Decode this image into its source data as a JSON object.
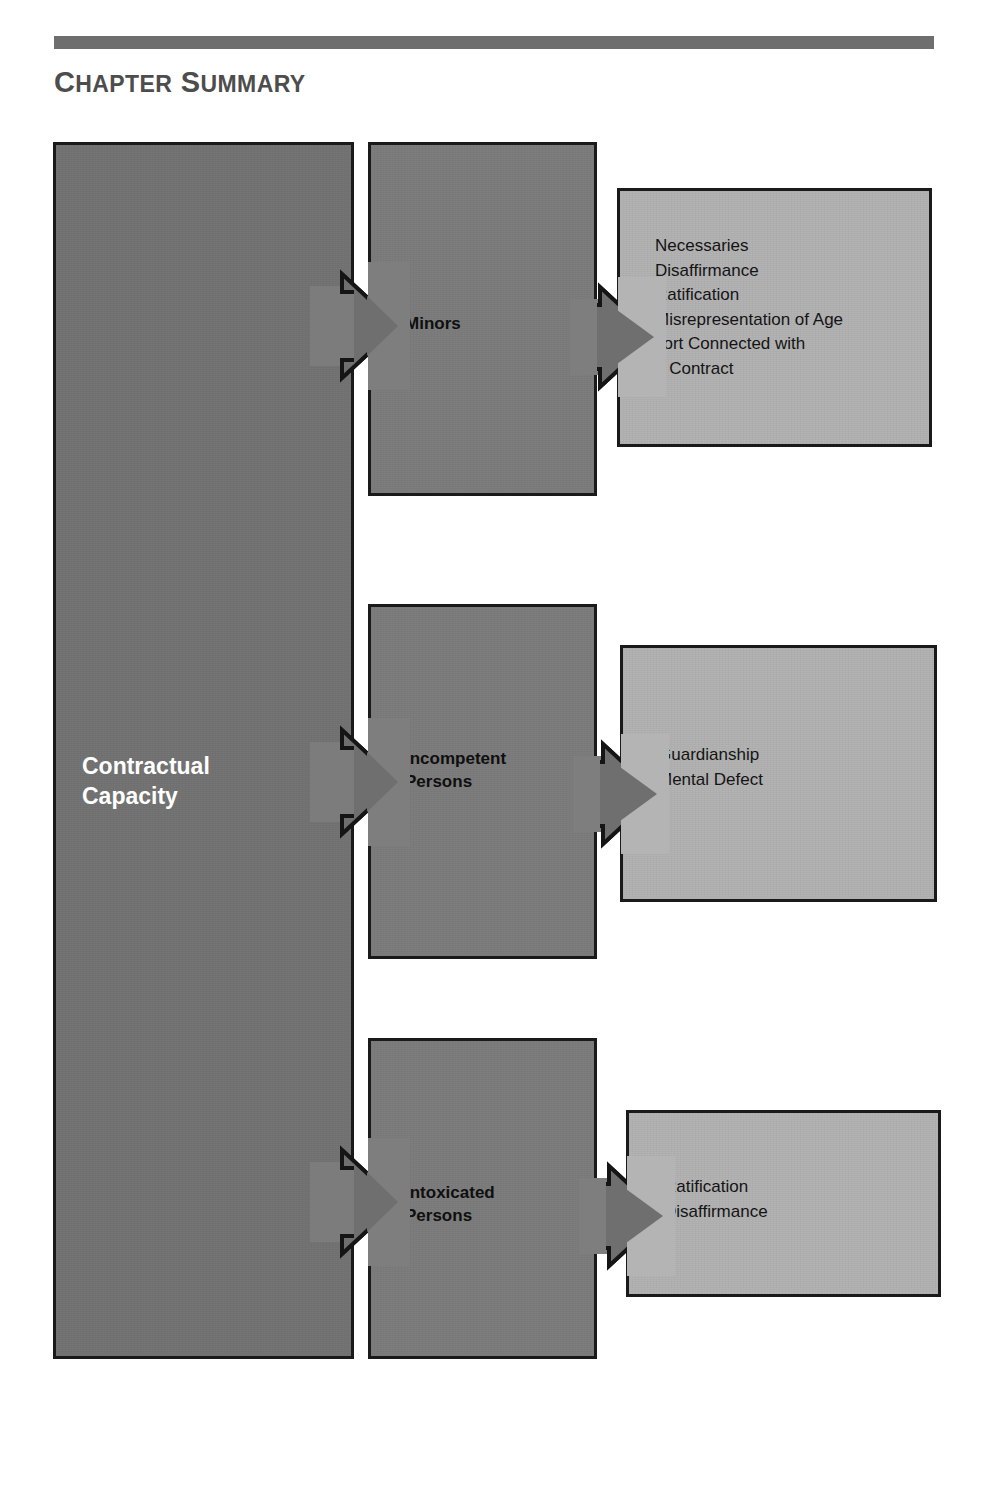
{
  "header": {
    "title_first_letter": "C",
    "title_word1_rest": "HAPTER",
    "title_second_letter": "S",
    "title_word2_rest": "UMMARY",
    "title_full": "CHAPTER SUMMARY"
  },
  "colors": {
    "rule": "#6e6e6e",
    "title_text": "#4d4d4d",
    "box_dark": "#757575",
    "box_mid": "#7e7e7e",
    "box_light": "#b4b4b4",
    "box_border": "#1a1a1a",
    "arrow_fill": "#6f6f6f",
    "white_text": "#ffffff",
    "dark_text": "#0f0f0f",
    "page_background": "#ffffff"
  },
  "diagram": {
    "root": {
      "label_line1": "Contractual",
      "label_line2": "Capacity"
    },
    "branches": [
      {
        "id": "minors",
        "label_line1": "Minors",
        "label_line2": "",
        "details": "Necessaries\nDisaffirmance\nRatification\nMisrepresentation of Age\nTort Connected with\n   Contract",
        "detail_items": [
          "Necessaries",
          "Disaffirmance",
          "Ratification",
          "Misrepresentation of Age",
          "Tort Connected with Contract"
        ]
      },
      {
        "id": "incompetent-persons",
        "label_line1": "Incompetent",
        "label_line2": "Persons",
        "details": "Guardianship\nMental Defect",
        "detail_items": [
          "Guardianship",
          "Mental Defect"
        ]
      },
      {
        "id": "intoxicated-persons",
        "label_line1": "Intoxicated",
        "label_line2": "Persons",
        "details": "Ratification\nDisaffirmance",
        "detail_items": [
          "Ratification",
          "Disaffirmance"
        ]
      }
    ]
  }
}
